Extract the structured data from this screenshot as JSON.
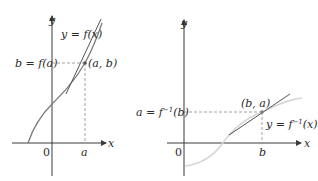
{
  "diagram": {
    "left_panel": {
      "title": "Graph of f with tangent at (a, b)",
      "axis_labels": {
        "x": "x",
        "y": "y"
      },
      "origin_label": "0",
      "curve_label": "y = f(x)",
      "point_label": "(a, b)",
      "y_tick_label": "b = f(a)",
      "x_tick_label": "a",
      "colors": {
        "curve": "#7d7d7d",
        "tangent": "#555555",
        "axes": "#3a3a3a",
        "guides": "#8a8a8a"
      }
    },
    "right_panel": {
      "title": "Graph of f inverse with tangent at (b, a)",
      "axis_labels": {
        "x": "x",
        "y": "y"
      },
      "origin_label": "0",
      "curve_label": "y = f^{-1}(x)",
      "curve_label_parts": {
        "pre": "y = f",
        "sup": "−1",
        "post": "(x)"
      },
      "point_label": "(b, a)",
      "y_tick_label_parts": {
        "pre": "a = f",
        "sup": "−1",
        "post": "(b)"
      },
      "x_tick_label": "b",
      "colors": {
        "curve": "#d6d6d6",
        "tangent": "#555555",
        "axes": "#3a3a3a",
        "guides": "#8a8a8a"
      }
    }
  }
}
